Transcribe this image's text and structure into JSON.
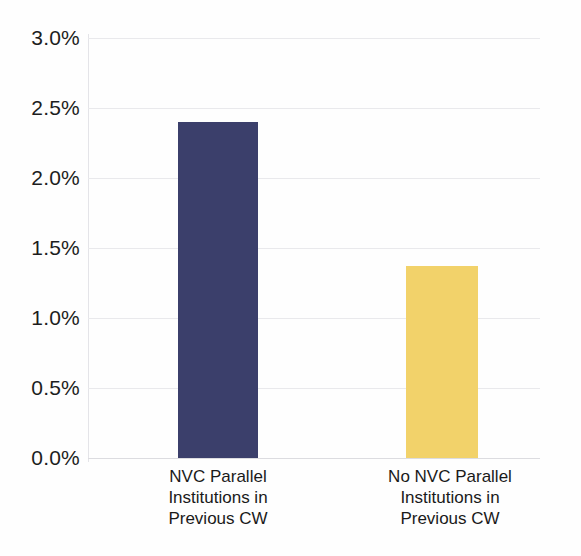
{
  "chart_data": {
    "type": "bar",
    "title": "",
    "subtitle": "",
    "xlabel": "",
    "ylabel": "",
    "categories": [
      "NVC Parallel\nInstitutions in\nPrevious CW",
      "No NVC Parallel\nInstitutions in\nPrevious CW"
    ],
    "values": [
      2.4,
      1.37
    ],
    "value_labels": [
      "2.4%",
      "1.37%"
    ],
    "ylim": [
      0.0,
      3.0
    ],
    "ytick_values": [
      0.0,
      0.5,
      1.0,
      1.5,
      2.0,
      2.5,
      3.0
    ],
    "ytick_labels": [
      "0.0%",
      "0.5%",
      "1.0%",
      "1.5%",
      "2.0%",
      "2.5%",
      "3.0%"
    ],
    "grid": true,
    "grid_axis": "y",
    "legend": false,
    "legend_position": "none",
    "bar_colors": [
      "#3b3f6b",
      "#f2d26a"
    ],
    "series": [
      {
        "name": "Rate",
        "values": [
          2.4,
          1.37
        ]
      }
    ],
    "annotations": []
  },
  "colors": {
    "background": "#fefefe",
    "gridline": "#e9e9ec",
    "axis_line": "#e4e4e8",
    "text": "#1a1a1a",
    "bar_dark_navy": "#3b3f6b",
    "bar_gold": "#f2d26a"
  }
}
